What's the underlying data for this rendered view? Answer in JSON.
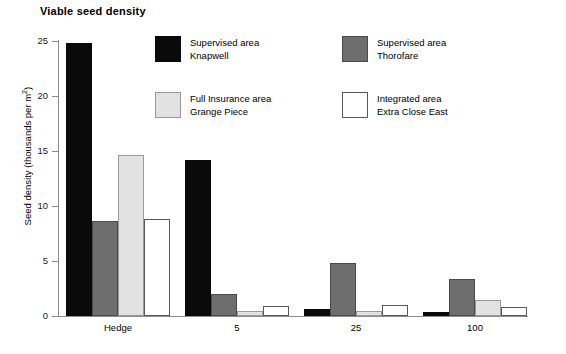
{
  "chart_data": {
    "type": "bar",
    "title": "Viable seed density",
    "xlabel": "",
    "ylabel": "Seed density (thousands per m²)",
    "ylabel_base": "Seed density (thousands per m",
    "ylabel_sup": "2",
    "ylabel_tail": ")",
    "categories": [
      "Hedge",
      "5",
      "25",
      "100"
    ],
    "ylim": [
      0,
      25
    ],
    "yticks": [
      0,
      5,
      10,
      15,
      20,
      25
    ],
    "ytick_labels": [
      "0",
      "5",
      "10",
      "15",
      "20",
      "25"
    ],
    "grid": false,
    "legend_position": "upper-center",
    "series": [
      {
        "name": "Supervised area Knapwell",
        "label_line1": "Supervised area",
        "label_line2": "Knapwell",
        "color": "#0a0a0a",
        "values": [
          24.8,
          14.2,
          0.6,
          0.35
        ]
      },
      {
        "name": "Supervised area Thorofare",
        "label_line1": "Supervised area",
        "label_line2": "Thorofare",
        "color": "#6e6e6e",
        "values": [
          8.6,
          2.0,
          4.8,
          3.4
        ]
      },
      {
        "name": "Full Insurance area Grange Piece",
        "label_line1": "Full Insurance area",
        "label_line2": "Grange Piece",
        "color": "#e2e2e2",
        "values": [
          14.6,
          0.5,
          0.5,
          1.5
        ]
      },
      {
        "name": "Integrated area Extra Close East",
        "label_line1": "Integrated area",
        "label_line2": "Extra Close East",
        "color": "#ffffff",
        "values": [
          8.8,
          0.9,
          1.0,
          0.8
        ]
      }
    ]
  }
}
